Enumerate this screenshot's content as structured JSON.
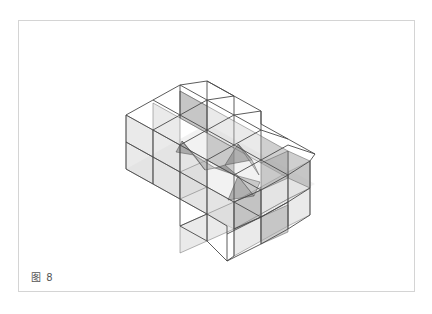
{
  "figure": {
    "caption": "图 8",
    "colors": {
      "background": "#ffffff",
      "frame_border": "#d4d4d4",
      "edge": "#4a4a4a",
      "panel_light": "#d9d9d9",
      "panel_mid": "#a8a8a8",
      "panel_dark": "#7a7a7a",
      "caption_text": "#555555"
    }
  }
}
